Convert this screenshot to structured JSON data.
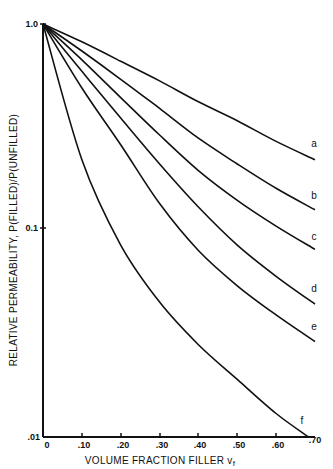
{
  "chart_data": {
    "type": "line",
    "title": "",
    "xlabel": "VOLUME FRACTION FILLER vf",
    "ylabel": "RELATIVE PERMEABILITY, P(FILLED)/P(UNFILLED)",
    "xlim": [
      0,
      0.7
    ],
    "ylim": [
      0.01,
      1.0
    ],
    "yscale": "log",
    "grid": false,
    "legend": "inline labels at curve ends",
    "x_ticks": [
      "0",
      ".10",
      ".20",
      ".30",
      ".40",
      ".50",
      ".60",
      ".70"
    ],
    "y_ticks": [
      "1.0",
      "0.1",
      ".01"
    ],
    "x": [
      0,
      0.1,
      0.2,
      0.3,
      0.4,
      0.5,
      0.6,
      0.7
    ],
    "series": [
      {
        "name": "a",
        "values": [
          1.0,
          0.82,
          0.66,
          0.53,
          0.42,
          0.34,
          0.27,
          0.22
        ]
      },
      {
        "name": "b",
        "values": [
          1.0,
          0.74,
          0.54,
          0.39,
          0.28,
          0.21,
          0.16,
          0.126
        ]
      },
      {
        "name": "c",
        "values": [
          1.0,
          0.67,
          0.44,
          0.29,
          0.195,
          0.14,
          0.105,
          0.081
        ]
      },
      {
        "name": "d",
        "values": [
          1.0,
          0.59,
          0.35,
          0.21,
          0.13,
          0.085,
          0.06,
          0.044
        ]
      },
      {
        "name": "e",
        "values": [
          1.0,
          0.49,
          0.26,
          0.135,
          0.08,
          0.054,
          0.039,
          0.029
        ]
      },
      {
        "name": "f",
        "values": [
          1.0,
          0.22,
          0.085,
          0.045,
          0.028,
          0.019,
          0.013,
          0.0095
        ]
      }
    ]
  },
  "labels": {
    "y_tick_top": "1.0",
    "y_tick_mid": "0.1",
    "y_tick_bottom": ".01",
    "x_ticks": [
      "0",
      ".10",
      ".20",
      ".30",
      ".40",
      ".50",
      ".60",
      ".70"
    ],
    "xlabel_main": "VOLUME FRACTION FILLER v",
    "xlabel_sub": "f",
    "ylabel": "RELATIVE PERMEABILITY, P(FILLED)/P(UNFILLED)",
    "curve_labels": [
      "a",
      "b",
      "c",
      "d",
      "e",
      "f"
    ]
  }
}
